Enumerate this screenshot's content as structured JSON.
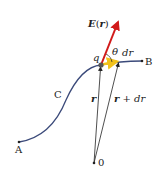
{
  "diagram": {
    "labels": {
      "field": "E(r)",
      "field_main": "E",
      "field_open": "(",
      "field_arg": "r",
      "field_close": ")",
      "theta": "θ",
      "dr": "dr",
      "charge": "q",
      "curve": "C",
      "start": "A",
      "end": "B",
      "origin": "0",
      "position": "r",
      "position_next_r": "r",
      "position_next_rest": " + dr"
    },
    "colors": {
      "curve": "#3b4a7a",
      "field_arrow": "#d11a1a",
      "dr_arrow": "#f2c21b",
      "vectors": "#222222",
      "charge_dot": "#555555"
    },
    "points": {
      "A": [
        19,
        142
      ],
      "q": [
        101,
        65
      ],
      "dr_end": [
        119,
        61
      ],
      "B": [
        142,
        61
      ],
      "O": [
        94,
        163
      ],
      "E_tip": [
        119,
        20
      ]
    }
  }
}
